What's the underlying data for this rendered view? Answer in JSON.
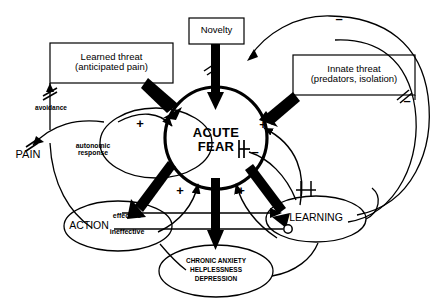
{
  "diagram": {
    "background_color": "#ffffff",
    "stroke_color": "#000000",
    "nodes": {
      "learned_threat": {
        "label": "Learned threat\n(anticipated pain)",
        "shape": "rectangle"
      },
      "novelty": {
        "label": "Novelty",
        "shape": "rectangle"
      },
      "innate_threat": {
        "label": "Innate threat\n(predators, isolation)",
        "shape": "rectangle"
      },
      "acute_fear": {
        "label": "ACUTE\nFEAR",
        "shape": "circle"
      },
      "pain": {
        "label": "PAIN",
        "shape": "text"
      },
      "avoidance": {
        "label": "avoidance",
        "shape": "text"
      },
      "autonomic_response": {
        "label": "autonomic\nresponse",
        "shape": "text"
      },
      "action": {
        "label": "ACTION",
        "shape": "ellipse"
      },
      "effective": {
        "label": "effective",
        "shape": "text"
      },
      "ineffective": {
        "label": "ineffective",
        "shape": "text"
      },
      "learning": {
        "label": "LEARNING",
        "shape": "ellipse"
      },
      "chronic": {
        "label": "CHRONIC ANXIETY\nHELPLESSNESS\nDEPRESSION",
        "shape": "ellipse"
      }
    },
    "signs": [
      {
        "id": "sign-minus-top-right",
        "symbol": "–",
        "x": 338,
        "y": 16
      },
      {
        "id": "sign-plus-left",
        "symbol": "+",
        "x": 139,
        "y": 124
      },
      {
        "id": "sign-plus-right",
        "symbol": "+",
        "x": 262,
        "y": 125
      },
      {
        "id": "sign-minus-right-center",
        "symbol": "–",
        "x": 254,
        "y": 150
      },
      {
        "id": "sign-minus-right-edge",
        "symbol": "–",
        "x": 406,
        "y": 99
      },
      {
        "id": "sign-plus-bottom-left",
        "symbol": "+",
        "x": 179,
        "y": 190
      },
      {
        "id": "sign-plus-bottom-right",
        "symbol": "+",
        "x": 240,
        "y": 190
      },
      {
        "id": "sign-minus-learning",
        "symbol": "–",
        "x": 305,
        "y": 183
      }
    ]
  }
}
